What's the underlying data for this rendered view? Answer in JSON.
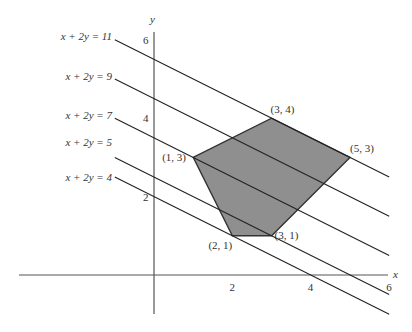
{
  "chart_data": {
    "type": "diagram-lp-feasible-region",
    "title": "",
    "xlabel": "x",
    "ylabel": "y",
    "xlim": [
      -3.5,
      6
    ],
    "ylim": [
      -1,
      6.2
    ],
    "grid": false,
    "x_ticks": [
      {
        "value": 2,
        "label": "2"
      },
      {
        "value": 4,
        "label": "4"
      },
      {
        "value": 6,
        "label": "6"
      }
    ],
    "y_ticks": [
      {
        "value": 2,
        "label": "2"
      },
      {
        "value": 4,
        "label": "4"
      },
      {
        "value": 6,
        "label": "6"
      }
    ],
    "feasible_region": {
      "vertices": [
        [
          1,
          3
        ],
        [
          3,
          4
        ],
        [
          5,
          3
        ],
        [
          3,
          1
        ],
        [
          2,
          1
        ]
      ],
      "fill": "#8f8f8f"
    },
    "vertex_labels": [
      {
        "point": [
          1,
          3
        ],
        "label": "(1, 3)"
      },
      {
        "point": [
          3,
          4
        ],
        "label": "(3, 4)"
      },
      {
        "point": [
          5,
          3
        ],
        "label": "(5, 3)"
      },
      {
        "point": [
          3,
          1
        ],
        "label": "(3, 1)"
      },
      {
        "point": [
          2,
          1
        ],
        "label": "(2, 1)"
      }
    ],
    "level_lines": [
      {
        "label": "x + 2y = 11",
        "c": 11
      },
      {
        "label": "x + 2y = 9",
        "c": 9
      },
      {
        "label": "x + 2y = 7",
        "c": 7
      },
      {
        "label": "x + 2y = 5",
        "c": 5
      },
      {
        "label": "x + 2y = 4",
        "c": 4
      }
    ],
    "line_x_range": [
      -1,
      6
    ]
  }
}
